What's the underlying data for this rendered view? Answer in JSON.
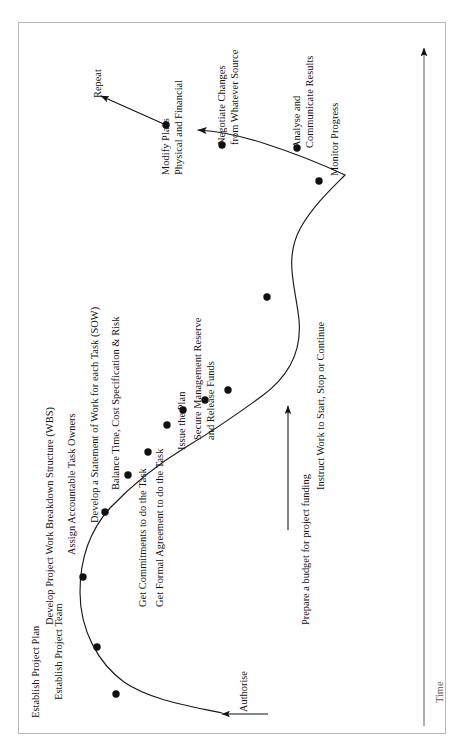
{
  "diagram": {
    "axis": {
      "label": "Time",
      "arrow_direction": "up"
    },
    "start_annotation": {
      "label": "Authorise",
      "arrow_direction": "left"
    },
    "funding_annotation": {
      "label": "Prepare a budget for project funding",
      "arrow_direction": "up"
    },
    "end_annotation": {
      "label": "Repeat",
      "arrow_direction": "up-left"
    },
    "colors": {
      "curve": "#1a1a1a",
      "dot": "#111111",
      "frame": "#b9b9b9",
      "text": "#111111"
    },
    "milestones": [
      {
        "id": "establish-project-team",
        "label": [
          "Establish Project Team"
        ],
        "x": 116,
        "y": 694
      },
      {
        "id": "establish-project-plan",
        "label": [
          "Establish Project Plan"
        ],
        "x": 97,
        "y": 647
      },
      {
        "id": "develop-project-wbs",
        "label": [
          "Develop Project Work Breakdown Structure (WBS)"
        ],
        "x": 83,
        "y": 577
      },
      {
        "id": "assign-accountable-task-owners",
        "label": [
          "Assign Accountable Task Owners"
        ],
        "x": 105,
        "y": 512
      },
      {
        "id": "develop-statement-of-work",
        "label": [
          "Develop a Statement of Work for each Task (SOW)"
        ],
        "x": 128,
        "y": 475
      },
      {
        "id": "balance-time-cost-spec-risk",
        "label": [
          "Balance Time, Cost Specification & Risk"
        ],
        "x": 148,
        "y": 452
      },
      {
        "id": "get-commitments-to-do-the-task",
        "label": [
          "Get Commitments to do the Task"
        ],
        "x": 167,
        "y": 425
      },
      {
        "id": "get-formal-agreement-to-do-task",
        "label": [
          "Get Formal Agreement to do the Task"
        ],
        "x": 183,
        "y": 410
      },
      {
        "id": "issue-the-plan",
        "label": [
          "Issue the Plan"
        ],
        "x": 205,
        "y": 400
      },
      {
        "id": "secure-management-reserve",
        "label": [
          "Secure Management Reserve",
          "and Release Funds"
        ],
        "x": 228,
        "y": 390
      },
      {
        "id": "instruct-work-start-stop-continue",
        "label": [
          "Instruct Work to Start, Stop or Continue"
        ],
        "x": 267,
        "y": 297
      },
      {
        "id": "monitor-progress",
        "label": [
          "Monitor Progress"
        ],
        "x": 319,
        "y": 181
      },
      {
        "id": "analyse-and-communicate-results",
        "label": [
          "Analyse and",
          "Communicate Results"
        ],
        "x": 297,
        "y": 148
      },
      {
        "id": "negotiate-changes",
        "label": [
          "Negotiate Changes",
          "from Whatever Source"
        ],
        "x": 222,
        "y": 145
      },
      {
        "id": "modify-plans",
        "label": [
          "Modify Plans",
          "Physical and Financial"
        ],
        "x": 166,
        "y": 125
      }
    ]
  },
  "labels": {
    "establish_project_team": "Establish Project Team",
    "establish_project_plan": "Establish Project Plan",
    "develop_wbs": "Develop Project Work Breakdown Structure (WBS)",
    "assign_owners": "Assign Accountable Task Owners",
    "develop_sow": "Develop a Statement of Work for each Task (SOW)",
    "balance": "Balance Time, Cost Specification & Risk",
    "get_commitments": "Get Commitments to do the Task",
    "get_formal_agreement": "Get Formal Agreement to do the Task",
    "issue_the_plan": "Issue the Plan",
    "secure_reserve_l1": "Secure Management Reserve",
    "secure_reserve_l2": "and Release Funds",
    "instruct_work": "Instruct Work to Start, Stop or Continue",
    "monitor_progress": "Monitor Progress",
    "analyse_l1": "Analyse and",
    "analyse_l2": "Communicate Results",
    "negotiate_l1": "Negotiate Changes",
    "negotiate_l2": "from Whatever Source",
    "modify_l1": "Modify Plans",
    "modify_l2": "Physical and Financial",
    "repeat": "Repeat",
    "authorise": "Authorise",
    "prepare_budget": "Prepare a budget for project funding",
    "time": "Time"
  }
}
